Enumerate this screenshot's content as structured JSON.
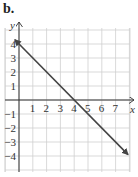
{
  "figure_label": "b.",
  "chart_data": {
    "type": "line",
    "title": "",
    "xlabel": "x",
    "ylabel": "y",
    "xlim": [
      -0.5,
      8
    ],
    "ylim": [
      -5,
      5
    ],
    "grid": true,
    "x_ticks": [
      "1",
      "2",
      "3",
      "4",
      "5",
      "6",
      "7"
    ],
    "y_ticks": [
      "4",
      "3",
      "2",
      "1",
      "-1",
      "-2",
      "-3",
      "-4"
    ],
    "series": [
      {
        "name": "line",
        "equation": "y = -x + 4",
        "slope": -1,
        "intercept": 4,
        "x": [
          -0.3,
          0,
          4,
          7.9
        ],
        "y": [
          4.3,
          4,
          0,
          -3.9
        ],
        "arrows": "both ends",
        "color": "#444444"
      }
    ]
  },
  "colors": {
    "grid": "#cfcfcf",
    "axis": "#333333",
    "line": "#444444"
  }
}
